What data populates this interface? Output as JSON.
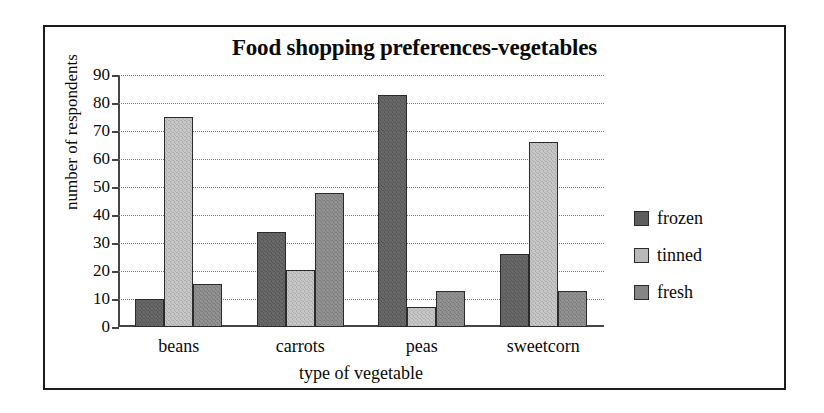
{
  "chart_data": {
    "type": "bar",
    "title": "Food shopping preferences-vegetables",
    "xlabel": "type of vegetable",
    "ylabel": "number of respondents",
    "categories": [
      "beans",
      "carrots",
      "peas",
      "sweetcorn"
    ],
    "series": [
      {
        "name": "frozen",
        "color": "#5d5d5d",
        "values": [
          10,
          34,
          83,
          26
        ]
      },
      {
        "name": "tinned",
        "color": "#b9b9b9",
        "values": [
          75,
          20.5,
          7,
          66
        ]
      },
      {
        "name": "fresh",
        "color": "#858585",
        "values": [
          15.5,
          48,
          13,
          13
        ]
      }
    ],
    "ylim": [
      0,
      90
    ],
    "yticks": [
      0,
      10,
      20,
      30,
      40,
      50,
      60,
      70,
      80,
      90
    ],
    "ytick_labels": [
      "0",
      "10",
      "20",
      "30",
      "40",
      "50",
      "60",
      "70",
      "80",
      "90"
    ],
    "grid": true,
    "grid_style": "dotted-horizontal",
    "legend_position": "right",
    "legend_entries": [
      "frozen",
      "tinned",
      "fresh"
    ]
  }
}
